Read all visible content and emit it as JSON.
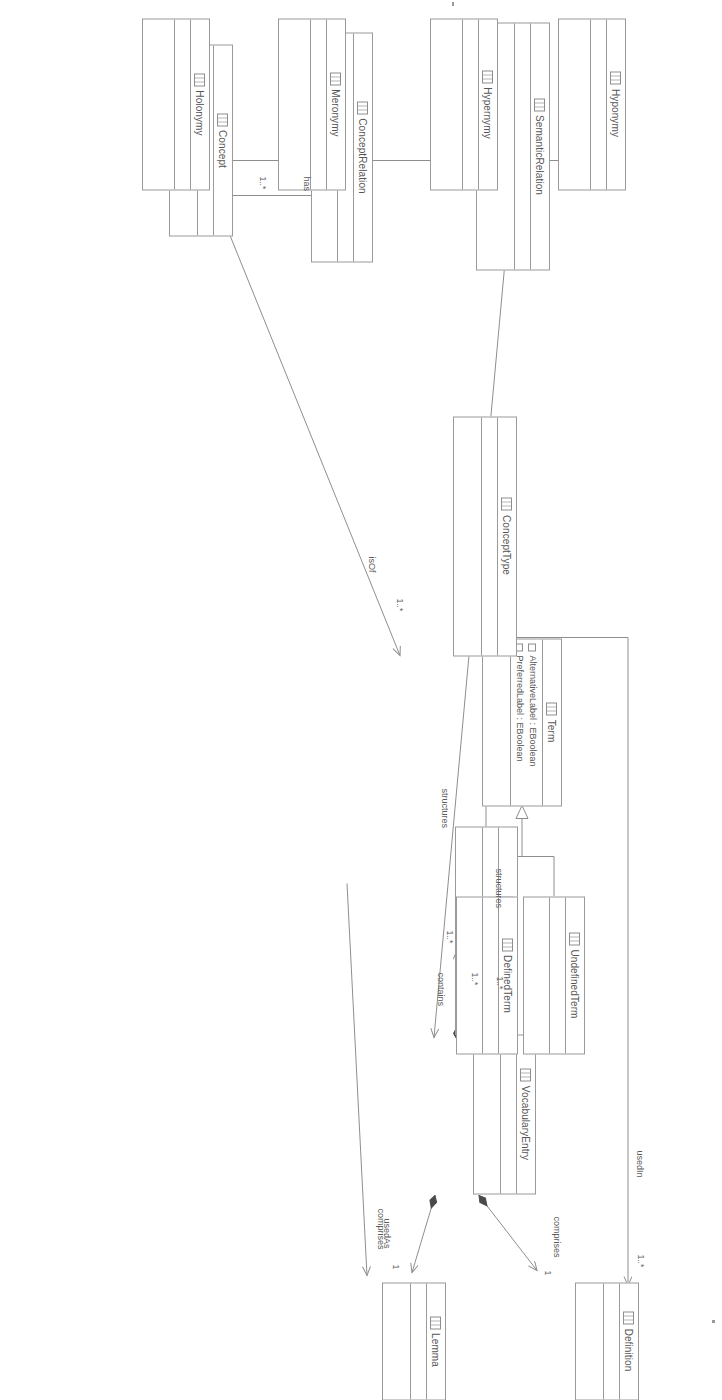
{
  "diagram": {
    "kind": "uml-class-diagram",
    "title": "",
    "orientation": "rotated-90-clockwise",
    "colors": {
      "stroke": "#9a9a9a",
      "text": "#555555",
      "background": "#ffffff",
      "filled_diamond": "#4a4a4a"
    }
  },
  "classes": [
    {
      "id": "definition",
      "name": "Definition",
      "attributes": []
    },
    {
      "id": "vocabularyentry",
      "name": "VocabularyEntry",
      "attributes": []
    },
    {
      "id": "vocabulary",
      "name": "Vocabulary",
      "attributes": []
    },
    {
      "id": "lemma",
      "name": "Lemma",
      "attributes": []
    },
    {
      "id": "undefinedterm",
      "name": "UndefinedTerm",
      "attributes": []
    },
    {
      "id": "definedterm",
      "name": "DefinedTerm",
      "attributes": []
    },
    {
      "id": "term",
      "name": "Term",
      "attributes": [
        "AlternativeLabel : EBoolean",
        "PreferredLabel : EBoolean"
      ]
    },
    {
      "id": "concepttype",
      "name": "ConceptType",
      "attributes": []
    },
    {
      "id": "concept",
      "name": "Concept",
      "attributes": []
    },
    {
      "id": "conceptrelation",
      "name": "ConceptRelation",
      "attributes": []
    },
    {
      "id": "semanticrelation",
      "name": "SemanticRelation",
      "attributes": []
    },
    {
      "id": "hyponymy",
      "name": "Hyponymy",
      "attributes": []
    },
    {
      "id": "hypernymy",
      "name": "Hypernymy",
      "attributes": []
    },
    {
      "id": "meronymy",
      "name": "Meronymy",
      "attributes": []
    },
    {
      "id": "holonymy",
      "name": "Holonymy",
      "attributes": []
    }
  ],
  "relationships": [
    {
      "id": "r1",
      "type": "composition",
      "from": "vocabularyentry",
      "to": "definition",
      "label": "comprises",
      "target_multiplicity": "1"
    },
    {
      "id": "r2",
      "type": "composition",
      "from": "vocabularyentry",
      "to": "lemma",
      "label": "comprises",
      "target_multiplicity": "1"
    },
    {
      "id": "r3",
      "type": "composition",
      "from": "vocabulary",
      "to": "vocabularyentry",
      "label": "contains",
      "target_multiplicity": "1..*"
    },
    {
      "id": "r4",
      "type": "association",
      "from": "term",
      "to": "definition",
      "label": "usedIn",
      "target_multiplicity": "1..*"
    },
    {
      "id": "r5",
      "type": "association",
      "from": "definedterm",
      "to": "lemma",
      "label": "usedAs",
      "target_multiplicity": ""
    },
    {
      "id": "r6",
      "type": "generalization",
      "from": "undefinedterm",
      "to": "term",
      "label": ""
    },
    {
      "id": "r7",
      "type": "generalization",
      "from": "definedterm",
      "to": "term",
      "label": ""
    },
    {
      "id": "r8",
      "type": "association",
      "from": "concepttype",
      "to": "vocabulary",
      "label": "structures",
      "target_multiplicity": "1..*"
    },
    {
      "id": "r9",
      "type": "association",
      "from": "semanticrelation",
      "to": "vocabulary",
      "label": "structures",
      "target_multiplicity": "1..*"
    },
    {
      "id": "r10",
      "type": "association",
      "from": "concept",
      "to": "concepttype",
      "label": "isOf",
      "target_multiplicity": "1..*"
    },
    {
      "id": "r11",
      "type": "association",
      "from": "concept",
      "to": "conceptrelation",
      "label": "has",
      "target_multiplicity": "1..*"
    },
    {
      "id": "r12",
      "type": "generalization",
      "from": "semanticrelation",
      "to": "conceptrelation",
      "label": ""
    },
    {
      "id": "r13",
      "type": "generalization",
      "from": "hyponymy",
      "to": "semanticrelation",
      "label": ""
    },
    {
      "id": "r14",
      "type": "generalization",
      "from": "hypernymy",
      "to": "semanticrelation",
      "label": ""
    },
    {
      "id": "r15",
      "type": "generalization",
      "from": "meronymy",
      "to": "semanticrelation",
      "label": ""
    },
    {
      "id": "r16",
      "type": "generalization",
      "from": "holonymy",
      "to": "semanticrelation",
      "label": ""
    }
  ],
  "edge_labels": {
    "comprises_definition": "comprises",
    "comprises_lemma": "comprises",
    "contains": "contains",
    "usedIn": "usedIn",
    "usedAs": "usedAs",
    "structures_concepttype": "structures",
    "structures_semanticrelation": "structures",
    "isOf": "isOf",
    "has": "has"
  },
  "multiplicities": {
    "definition_end": "1",
    "lemma_end": "1",
    "vocabularyentry_end": "1..*",
    "usedIn_end": "1..*",
    "structures_concepttype_end": "1..*",
    "structures_semanticrelation_end": "1..*",
    "isOf_end": "1..*",
    "has_end": "1..*"
  }
}
